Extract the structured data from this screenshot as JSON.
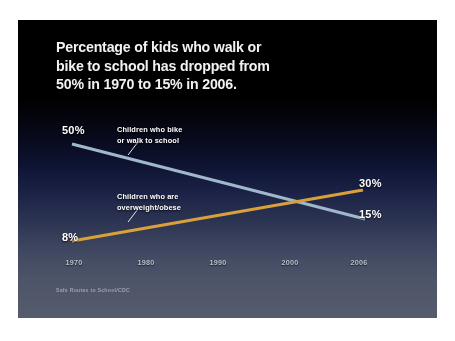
{
  "slide": {
    "title_lines": [
      "Percentage of kids who walk or",
      "bike to school has dropped from",
      "50% in 1970 to 15% in 2006."
    ],
    "source_note": "Safe Routes to School/CDC",
    "background_top_color": "#000000",
    "background_bottom_color": "#555c6d"
  },
  "chart_data": {
    "type": "line",
    "title": "Percentage of kids who walk or bike to school has dropped from 50% in 1970 to 15% in 2006.",
    "xlabel": "",
    "ylabel": "",
    "x": [
      1970,
      1980,
      1990,
      2000,
      2006
    ],
    "tick_labels": [
      "1970",
      "1980",
      "1990",
      "2000",
      "2006"
    ],
    "xlim": [
      1970,
      2006
    ],
    "ylim": [
      0,
      55
    ],
    "grid": false,
    "legend": "inline-annotations",
    "series": [
      {
        "name": "Children who bike or walk to school",
        "color": "#9fb8cc",
        "endpoint_values": [
          50,
          15
        ],
        "start_label": "50%",
        "end_label": "15%",
        "annotation_lines": [
          "Children who bike",
          "or walk to school"
        ]
      },
      {
        "name": "Children who are overweight/obese",
        "color": "#d9a13a",
        "endpoint_values": [
          8,
          30
        ],
        "start_label": "8%",
        "end_label": "30%",
        "annotation_lines": [
          "Children who are",
          "overweight/obese"
        ]
      }
    ],
    "annotations": [
      {
        "text": "50%",
        "series": "Children who bike or walk to school",
        "position": "start"
      },
      {
        "text": "15%",
        "series": "Children who bike or walk to school",
        "position": "end"
      },
      {
        "text": "8%",
        "series": "Children who are overweight/obese",
        "position": "start"
      },
      {
        "text": "30%",
        "series": "Children who are overweight/obese",
        "position": "end"
      }
    ],
    "source": "Safe Routes to School/CDC"
  }
}
